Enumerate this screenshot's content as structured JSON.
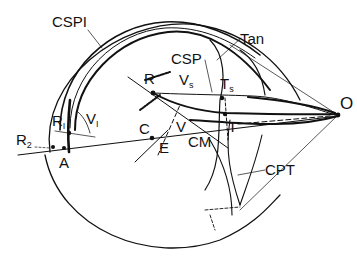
{
  "labels": {
    "csp1": "CSPI",
    "csp": "CSP",
    "tan": "Tan",
    "r": "R",
    "vs_main": "V",
    "vs_sub": "s",
    "ts_main": "T",
    "ts_sub": "s",
    "o": "O",
    "t": "T",
    "r1_main": "R",
    "r1_sub": "I",
    "v1_main": "V",
    "v1_sub": "I",
    "r2_main": "R",
    "r2_sub": "2",
    "a": "A",
    "c": "C",
    "e": "E",
    "v": "V",
    "cm": "CM",
    "cpt": "CPT"
  },
  "colors": {
    "ink": "#111111",
    "background": "#ffffff"
  }
}
